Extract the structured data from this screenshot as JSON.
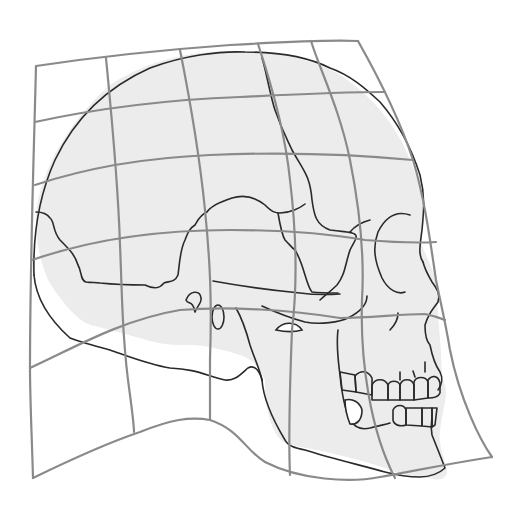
{
  "figure": {
    "subject": "Human skull in lateral view overlaid on a deformed Cartesian coordinate grid",
    "style": "line drawing",
    "colors": {
      "background": "#ffffff",
      "skull_fill": "#ececec",
      "outline": "#2a2a2a",
      "grid": "#8a8a8a"
    },
    "grid": {
      "vertical_lines": 6,
      "horizontal_lines": 6,
      "deformation": "curvilinear transformation grid"
    },
    "parts": [
      "cranium",
      "coronal-suture",
      "squamosal-suture",
      "orbit",
      "nasal-aperture",
      "zygomatic-arch",
      "mastoid-process",
      "external-auditory-meatus",
      "maxilla",
      "upper-teeth",
      "mandible",
      "lower-teeth"
    ]
  }
}
